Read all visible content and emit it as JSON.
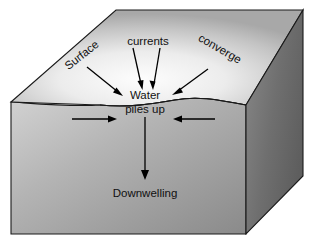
{
  "figure": {
    "type": "oceanography-block-diagram",
    "background_color": "#ffffff"
  },
  "labels": {
    "surface": "Surface",
    "currents": "currents",
    "converge": "converge",
    "water": "Water",
    "piles_up": "piles up",
    "downwelling": "Downwelling"
  },
  "colors": {
    "top_face_light": "#fbfbfb",
    "top_face_edge": "#adadad",
    "front_face_light": "#c9c9c9",
    "front_face_dark": "#8d8d8d",
    "right_face_light": "#7e7e7e",
    "right_face_dark": "#616161",
    "outline": "#1a1a1a",
    "arrow": "#000000",
    "text": "#111111"
  },
  "arrows": {
    "surface_arrow": {
      "label": "surface-inflow-arrow",
      "direction": "down-right"
    },
    "currents_arrow_left": {
      "label": "currents-arrow-left",
      "direction": "down"
    },
    "currents_arrow_right": {
      "label": "currents-arrow-right",
      "direction": "down"
    },
    "converge_arrow": {
      "label": "converge-inflow-arrow",
      "direction": "down-left"
    },
    "horizontal_left": {
      "label": "horizontal-flow-right-arrow",
      "direction": "right"
    },
    "horizontal_right": {
      "label": "horizontal-flow-left-arrow",
      "direction": "left"
    },
    "downwelling_arrow": {
      "label": "downwelling-arrow",
      "direction": "down"
    }
  },
  "geometry": {
    "box_top_left": [
      11,
      102
    ],
    "box_top_apex": [
      116,
      10
    ],
    "box_top_right": [
      303,
      10
    ],
    "box_front_right": [
      246,
      105
    ],
    "box_bottom_left": [
      11,
      234
    ],
    "box_bottom_right": [
      246,
      234
    ],
    "box_right_back_bottom": [
      303,
      176
    ]
  }
}
